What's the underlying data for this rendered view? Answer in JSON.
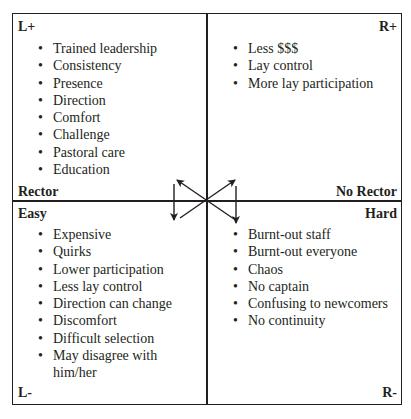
{
  "quadrants": {
    "top_left": {
      "corner_label": "L+",
      "edge_label": "Rector",
      "items": [
        "Trained leadership",
        "Consistency",
        "Presence",
        "Direction",
        "Comfort",
        "Challenge",
        "Pastoral care",
        "Education"
      ]
    },
    "top_right": {
      "corner_label": "R+",
      "edge_label": "No Rector",
      "items": [
        "Less $$$",
        "Lay control",
        "More lay participation"
      ]
    },
    "bottom_left": {
      "corner_label": "L-",
      "edge_label": "Easy",
      "items": [
        "Expensive",
        "Quirks",
        "Lower participation",
        "Less lay control",
        "Direction can change",
        "Discomfort",
        "Difficult selection",
        "May disagree with him/her"
      ]
    },
    "bottom_right": {
      "corner_label": "R-",
      "edge_label": "Hard",
      "items": [
        "Burnt-out staff",
        "Burnt-out everyone",
        "Chaos",
        "No captain",
        "Confusing to newcomers",
        "No continuity"
      ]
    }
  },
  "colors": {
    "ink": "#231f20",
    "background": "#ffffff"
  }
}
